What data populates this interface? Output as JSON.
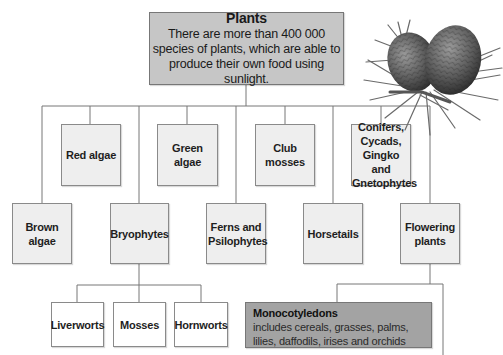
{
  "diagram": {
    "root": {
      "title": "Plants",
      "description": "There are more than 400 000 species of plants, which are able to produce their own food using sunlight."
    },
    "upper_row": [
      {
        "id": "red-algae",
        "label": "Red algae"
      },
      {
        "id": "green-algae",
        "label": "Green algae"
      },
      {
        "id": "club-mosses",
        "label": "Club mosses"
      },
      {
        "id": "conifers",
        "label": "Conifers, Cycads, Gingko and Gnetophytes"
      }
    ],
    "lower_row": [
      {
        "id": "brown-algae",
        "label": "Brown algae"
      },
      {
        "id": "bryophytes",
        "label": "Bryophytes"
      },
      {
        "id": "ferns",
        "label": "Ferns and Psilophytes"
      },
      {
        "id": "horsetails",
        "label": "Horsetails"
      },
      {
        "id": "flowering-plants",
        "label": "Flowering plants"
      }
    ],
    "bryophyte_children": [
      {
        "id": "liverworts",
        "label": "Liverworts"
      },
      {
        "id": "mosses",
        "label": "Mosses"
      },
      {
        "id": "hornworts",
        "label": "Hornworts"
      }
    ],
    "flowering_children": [
      {
        "id": "monocotyledons",
        "title": "Monocotyledons",
        "description": "includes cereals, grasses, palms, lilies, daffodils, irises and orchids"
      }
    ],
    "illustration": "pine-cones-icon",
    "colors": {
      "root_fill": "#c6c6c6",
      "node_fill": "#eeeeee",
      "leaf_fill": "#ffffff",
      "monocot_fill": "#a3a3a3",
      "line": "#777777"
    }
  }
}
